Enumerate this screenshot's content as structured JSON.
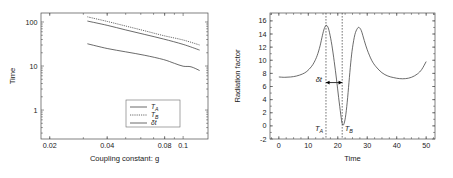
{
  "figure": {
    "panels": [
      {
        "id": "left",
        "chart_data": {
          "type": "line",
          "title": "",
          "xlabel": "Coupling constant: g",
          "ylabel": "Time",
          "xscale": "log",
          "yscale": "log",
          "xlim": [
            0.018,
            0.135
          ],
          "ylim": [
            0.22,
            160
          ],
          "xticks": [
            0.02,
            0.04,
            0.08,
            0.1
          ],
          "xticklabels": [
            "0.02",
            "0.04",
            "0.08",
            "0.1"
          ],
          "yticks": [
            1,
            10,
            100
          ],
          "yticklabels": [
            "1",
            "10",
            "100"
          ],
          "grid": false,
          "legend_position": "lower right",
          "series": [
            {
              "name": "T_A",
              "label": "T",
              "sublabel": "A",
              "style": "solid",
              "x": [
                0.0315,
                0.04,
                0.05,
                0.063,
                0.079,
                0.1,
                0.122
              ],
              "y": [
                105,
                84,
                66,
                52,
                41,
                31,
                23
              ]
            },
            {
              "name": "T_B",
              "label": "T",
              "sublabel": "B",
              "style": "dotted",
              "x": [
                0.0315,
                0.04,
                0.05,
                0.063,
                0.079,
                0.1,
                0.122
              ],
              "y": [
                131,
                103,
                81,
                63,
                49,
                39,
                30
              ]
            },
            {
              "name": "delta_t",
              "label": "δt",
              "sublabel": "",
              "style": "solid-thin",
              "x": [
                0.0315,
                0.04,
                0.05,
                0.063,
                0.079,
                0.09,
                0.1,
                0.11,
                0.122
              ],
              "y": [
                32,
                25,
                21,
                17.5,
                14.0,
                11.5,
                9.9,
                9.6,
                7.9
              ]
            }
          ]
        }
      },
      {
        "id": "right",
        "chart_data": {
          "type": "line",
          "title": "",
          "xlabel": "Time",
          "ylabel": "Radiation factor",
          "xscale": "linear",
          "yscale": "linear",
          "xlim": [
            -3,
            53
          ],
          "ylim": [
            -2,
            17.2
          ],
          "xticks": [
            0,
            10,
            20,
            30,
            40,
            50
          ],
          "xticklabels": [
            "0",
            "10",
            "20",
            "30",
            "40",
            "50"
          ],
          "yticks": [
            -2,
            0,
            2,
            4,
            6,
            8,
            10,
            12,
            14,
            16
          ],
          "yticklabels": [
            "-2",
            "0",
            "2",
            "4",
            "6",
            "8",
            "10",
            "12",
            "14",
            "16"
          ],
          "grid": false,
          "series": [
            {
              "name": "radiation_factor",
              "style": "solid",
              "x": [
                0,
                2,
                4,
                6,
                8,
                9.5,
                11,
                12,
                13,
                14,
                14.8,
                15.4,
                16,
                16.6,
                17.2,
                18,
                18.8,
                19.6,
                20.3,
                21,
                21.5,
                22,
                22.6,
                23.2,
                23.8,
                24.4,
                25,
                25.8,
                26.6,
                27.2,
                28,
                29,
                30,
                31.5,
                33,
                35,
                37,
                39,
                41,
                43,
                45,
                47,
                48.5,
                50
              ],
              "y": [
                7.45,
                7.4,
                7.45,
                7.6,
                7.9,
                8.3,
                9.0,
                9.7,
                10.7,
                12.2,
                13.8,
                14.8,
                15.3,
                15.1,
                14.2,
                12.3,
                9.8,
                7.0,
                4.3,
                1.8,
                0.35,
                0.2,
                1.3,
                3.6,
                6.6,
                9.6,
                11.9,
                13.9,
                14.8,
                15.0,
                14.5,
                13.0,
                11.6,
                10.0,
                9.0,
                8.1,
                7.6,
                7.35,
                7.2,
                7.2,
                7.4,
                7.9,
                8.6,
                9.8
              ]
            }
          ],
          "annotations": [
            {
              "name": "t-a-guide",
              "type": "vline",
              "x": 16.0,
              "label": "T",
              "sublabel": "A",
              "style": "dotted"
            },
            {
              "name": "t-b-guide",
              "type": "vline",
              "x": 21.5,
              "label": "T",
              "sublabel": "B",
              "style": "dotted"
            },
            {
              "name": "delta-t-arrow",
              "type": "double-arrow",
              "x0": 16.0,
              "x1": 21.5,
              "y": 6.6,
              "label": "δt"
            }
          ]
        }
      }
    ]
  },
  "colors": {
    "curve": "#3a3a3a",
    "axis": "#4a4a4a",
    "annotation": "#000000",
    "background": "#ffffff"
  }
}
